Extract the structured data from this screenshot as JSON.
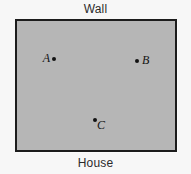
{
  "figure": {
    "width": 191,
    "height": 174,
    "background_color": "#f7f7f7",
    "top_caption": "Wall",
    "bottom_caption": "House"
  },
  "yard": {
    "name": "yard-rectangle",
    "fill_color": "#b6b6b6",
    "border_color": "#1c1c1c",
    "x": 15,
    "y": 19,
    "width": 162,
    "height": 133
  },
  "points": [
    {
      "label": "A",
      "x": 54,
      "y": 59,
      "label_position": "left",
      "dot_color": "#121212"
    },
    {
      "label": "B",
      "x": 137,
      "y": 61,
      "label_position": "right",
      "dot_color": "#121212"
    },
    {
      "label": "C",
      "x": 95,
      "y": 120,
      "label_position": "below-right",
      "dot_color": "#121212"
    }
  ],
  "chart_data": {
    "type": "scatter",
    "title": "",
    "xlabel": "",
    "ylabel": "",
    "annotations": [
      "Wall",
      "House"
    ],
    "grid": false,
    "legend": "none",
    "series": [
      {
        "name": "points",
        "points": [
          {
            "name": "A",
            "x": 54,
            "y": 59
          },
          {
            "name": "B",
            "x": 137,
            "y": 61
          },
          {
            "name": "C",
            "x": 95,
            "y": 120
          }
        ]
      }
    ],
    "xlim": [
      15,
      177
    ],
    "ylim": [
      19,
      152
    ]
  }
}
